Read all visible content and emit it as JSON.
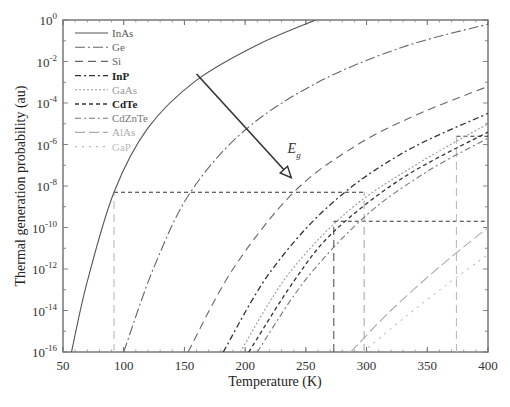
{
  "chart_data": {
    "type": "line",
    "title": "",
    "xlabel": "Temperature (K)",
    "ylabel": "Thermal generation probability (au)",
    "xlim": [
      50,
      400
    ],
    "ylim_log10": [
      -16,
      0
    ],
    "yscale": "log",
    "grid": false,
    "legend_position": "upper left",
    "x_ticks": [
      50,
      100,
      150,
      200,
      250,
      300,
      350,
      400
    ],
    "y_ticks": [
      {
        "exp": "0",
        "value": 0
      },
      {
        "exp": "-2",
        "value": -2
      },
      {
        "exp": "-4",
        "value": -4
      },
      {
        "exp": "-6",
        "value": -6
      },
      {
        "exp": "-8",
        "value": -8
      },
      {
        "exp": "-10",
        "value": -10
      },
      {
        "exp": "-12",
        "value": -12
      },
      {
        "exp": "-14",
        "value": -14
      },
      {
        "exp": "-16",
        "value": -16
      }
    ],
    "series": [
      {
        "name": "InAs",
        "color": "#555555",
        "dash": "",
        "bold": false,
        "points_T_log10P": [
          [
            57,
            -16
          ],
          [
            70,
            -12.6
          ],
          [
            92,
            -8.3
          ],
          [
            120,
            -5.2
          ],
          [
            160,
            -2.9
          ],
          [
            210,
            -1.2
          ],
          [
            258,
            0
          ]
        ]
      },
      {
        "name": "Ge",
        "color": "#666666",
        "dash": "10,3,2,3",
        "bold": false,
        "points_T_log10P": [
          [
            100,
            -16
          ],
          [
            125,
            -11.9
          ],
          [
            155,
            -8.3
          ],
          [
            200,
            -5.3
          ],
          [
            260,
            -3.0
          ],
          [
            330,
            -1.3
          ],
          [
            400,
            -0.2
          ]
        ]
      },
      {
        "name": "Si",
        "color": "#666666",
        "dash": "8,5",
        "bold": false,
        "points_T_log10P": [
          [
            153,
            -16
          ],
          [
            190,
            -12.0
          ],
          [
            240,
            -8.3
          ],
          [
            290,
            -6.1
          ],
          [
            340,
            -4.6
          ],
          [
            400,
            -3.2
          ]
        ]
      },
      {
        "name": "InP",
        "color": "#333333",
        "dash": "6,3,2,3",
        "bold": true,
        "points_T_log10P": [
          [
            182,
            -16
          ],
          [
            220,
            -12.2
          ],
          [
            270,
            -8.9
          ],
          [
            330,
            -6.4
          ],
          [
            400,
            -4.5
          ]
        ]
      },
      {
        "name": "GaAs",
        "color": "#999999",
        "dash": "2,2",
        "bold": false,
        "points_T_log10P": [
          [
            196,
            -16
          ],
          [
            235,
            -12.3
          ],
          [
            285,
            -9.2
          ],
          [
            340,
            -7.0
          ],
          [
            400,
            -5.0
          ]
        ]
      },
      {
        "name": "CdTe",
        "color": "#333333",
        "dash": "4,3",
        "bold": true,
        "points_T_log10P": [
          [
            203,
            -16
          ],
          [
            240,
            -12.6
          ],
          [
            273,
            -10.2
          ],
          [
            330,
            -7.6
          ],
          [
            400,
            -5.4
          ]
        ]
      },
      {
        "name": "CdZnTe",
        "color": "#777777",
        "dash": "6,3,2,3",
        "bold": false,
        "points_T_log10P": [
          [
            210,
            -16
          ],
          [
            250,
            -12.5
          ],
          [
            300,
            -9.4
          ],
          [
            350,
            -7.3
          ],
          [
            400,
            -5.7
          ]
        ]
      },
      {
        "name": "AlAs",
        "color": "#aaaaaa",
        "dash": "10,4",
        "bold": false,
        "points_T_log10P": [
          [
            287,
            -16
          ],
          [
            320,
            -14.0
          ],
          [
            360,
            -11.9
          ],
          [
            400,
            -10.0
          ]
        ]
      },
      {
        "name": "GaP",
        "color": "#bbbbbb",
        "dash": "2,5",
        "bold": false,
        "points_T_log10P": [
          [
            297,
            -16
          ],
          [
            330,
            -14.4
          ],
          [
            365,
            -12.8
          ],
          [
            400,
            -11.3
          ]
        ]
      }
    ],
    "reference_lines": [
      {
        "type": "h",
        "log10P": -8.3,
        "from_T": 92,
        "to_T": 298,
        "color": "#333333",
        "dash": "4,3"
      },
      {
        "type": "h",
        "log10P": -9.7,
        "from_T": 273,
        "to_T": 400,
        "color": "#333333",
        "dash": "4,3"
      },
      {
        "type": "h",
        "log10P": -5.6,
        "from_T": 374,
        "to_T": 400,
        "color": "#333333",
        "dash": "4,3"
      },
      {
        "type": "v",
        "T": 92,
        "from_log10P": -16,
        "to_log10P": -8.3,
        "color": "#bbbbbb",
        "dash": "8,5"
      },
      {
        "type": "v",
        "T": 273,
        "from_log10P": -16,
        "to_log10P": -9.7,
        "color": "#555555",
        "dash": "8,5"
      },
      {
        "type": "v",
        "T": 298,
        "from_log10P": -16,
        "to_log10P": -8.3,
        "color": "#aaaaaa",
        "dash": "8,5"
      },
      {
        "type": "v",
        "T": 374,
        "from_log10P": -16,
        "to_log10P": -5.6,
        "color": "#bbbbbb",
        "dash": "8,5"
      }
    ],
    "annotations": [
      {
        "text": "E",
        "subscript": "g",
        "T": 230,
        "log10P": -6.3,
        "arrow_from": [
          160,
          -2.6
        ],
        "arrow_to": [
          238,
          -7.6
        ]
      }
    ]
  }
}
